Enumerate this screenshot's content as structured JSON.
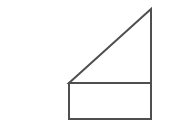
{
  "figure": {
    "title": "Composite figure: right triangle above rectangle",
    "canvas": {
      "width": 169,
      "height": 137,
      "background_color": "#ffffff"
    },
    "style": {
      "stroke_color": "#4f4f4f",
      "stroke_width": 2,
      "fill_color": "#ffffff"
    },
    "points": {
      "triangle_apex": {
        "x": 151,
        "y": 9
      },
      "triangle_left": {
        "x": 69,
        "y": 83
      },
      "triangle_right_angle": {
        "x": 151,
        "y": 83
      },
      "rect_top_left": {
        "x": 69,
        "y": 83
      },
      "rect_top_right": {
        "x": 151,
        "y": 83
      },
      "rect_bottom_right": {
        "x": 151,
        "y": 119
      },
      "rect_bottom_left": {
        "x": 69,
        "y": 119
      }
    },
    "shapes": {
      "triangle": {
        "name": "right-triangle",
        "points": "151,9 69,83 151,83"
      },
      "rectangle": {
        "name": "rectangle",
        "x": 69,
        "y": 83,
        "width": 82,
        "height": 36
      },
      "divider": {
        "name": "shared-horizontal-edge",
        "x1": 69,
        "y1": 83,
        "x2": 151,
        "y2": 83
      }
    }
  }
}
